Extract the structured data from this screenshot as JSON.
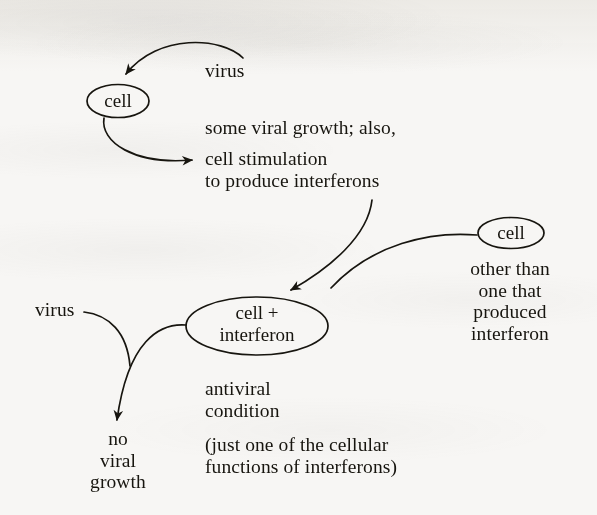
{
  "diagram": {
    "background_color": "#f7f6f4",
    "ink_color": "#17150f",
    "nodes": [
      {
        "id": "cell-top",
        "label": "cell",
        "shape": "ellipse"
      },
      {
        "id": "cell-right",
        "label": "cell",
        "shape": "ellipse"
      },
      {
        "id": "cell-interferon",
        "label": "cell +\ninterferon",
        "shape": "ellipse"
      }
    ],
    "labels": {
      "virus_top": "virus",
      "virus_bottom": "virus",
      "stimulation_line1": "some viral growth; also,",
      "stimulation_line2": "cell stimulation",
      "stimulation_line3": "to produce interferons",
      "other_than": "other than\none that\nproduced\ninterferon",
      "antiviral_condition": "antiviral\ncondition",
      "parenthetical": "(just one of the cellular\nfunctions of interferons)",
      "no_viral_growth": "no\nviral\ngrowth"
    },
    "node_labels": {
      "cell_top": "cell",
      "cell_right": "cell",
      "cell_interferon_line1": "cell +",
      "cell_interferon_line2": "interferon"
    },
    "edges": [
      {
        "id": "virus-to-cell",
        "from": "virus_top",
        "to": "cell-top",
        "arrow": true
      },
      {
        "id": "cell-to-stimulation",
        "from": "cell-top",
        "to": "stimulation_line2",
        "arrow": true
      },
      {
        "id": "interferon-to-cellplus",
        "from": "stimulation_line3",
        "to": "cell-interferon",
        "arrow": true
      },
      {
        "id": "cellright-to-cellplus",
        "from": "cell-right",
        "to": "cell-interferon",
        "arrow": false
      },
      {
        "id": "virus-bottom-curve",
        "from": "virus_bottom",
        "to": "crossing",
        "arrow": false
      },
      {
        "id": "cellplus-to-nogrowth",
        "from": "cell-interferon",
        "to": "no_viral_growth",
        "arrow": true
      }
    ]
  }
}
